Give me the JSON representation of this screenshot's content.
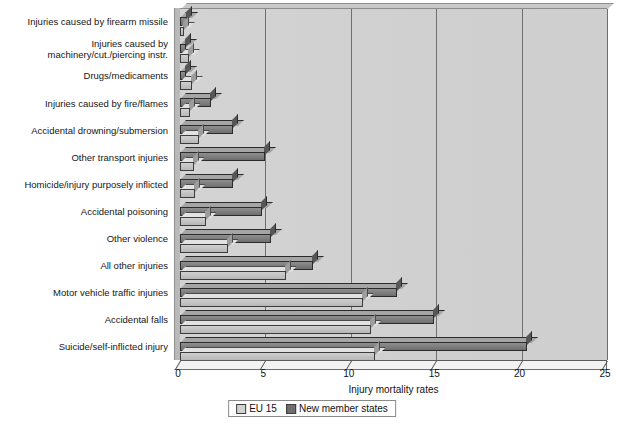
{
  "chart_data": {
    "type": "bar",
    "orientation": "horizontal",
    "title": "",
    "xlabel": "Injury mortality rates",
    "ylabel": "",
    "xlim": [
      0,
      25
    ],
    "xticks": [
      0,
      5,
      10,
      15,
      20,
      25
    ],
    "grid": true,
    "legend_position": "bottom",
    "categories": [
      "Injuries caused by firearm missile",
      "Injuries caused by\nmachinery/cut./piercing instr.",
      "Drugs/medicaments",
      "Injuries caused by fire/flames",
      "Accidental drowning/submersion",
      "Other transport injuries",
      "Homicide/injury purposely inflicted",
      "Accidental poisoning",
      "Other violence",
      "All other injuries",
      "Motor vehicle traffic injuries",
      "Accidental falls",
      "Suicide/self-inflicted injury"
    ],
    "series": [
      {
        "name": "EU 15",
        "color": "#c8c8c8",
        "values": [
          0.25,
          0.5,
          0.7,
          0.6,
          1.1,
          0.8,
          0.9,
          1.5,
          2.8,
          6.2,
          10.7,
          11.2,
          11.4
        ]
      },
      {
        "name": "New member states",
        "color": "#6e6e6e",
        "values": [
          0.4,
          0.35,
          0.35,
          1.8,
          3.1,
          5.0,
          3.1,
          4.8,
          5.3,
          7.8,
          12.7,
          14.9,
          20.3
        ]
      }
    ]
  },
  "legend": {
    "items": [
      {
        "label": "EU 15",
        "swatch": "eu"
      },
      {
        "label": "New member states",
        "swatch": "nms"
      }
    ]
  },
  "axis": {
    "x_title": "Injury mortality rates",
    "tick_labels": [
      "0",
      "5",
      "10",
      "15",
      "20",
      "25"
    ]
  }
}
